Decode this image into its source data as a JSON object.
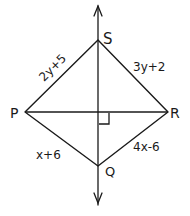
{
  "diagram": {
    "type": "kite/rhombus with diagonals",
    "vertices": {
      "S": {
        "label": "S",
        "x": 98,
        "y": 40
      },
      "R": {
        "label": "R",
        "x": 168,
        "y": 112
      },
      "Q": {
        "label": "Q",
        "x": 98,
        "y": 166
      },
      "P": {
        "label": "P",
        "x": 25,
        "y": 112
      }
    },
    "sides": {
      "PS": "2y+5",
      "SR": "3y+2",
      "PQ": "x+6",
      "QR": "4x-6"
    },
    "axis": {
      "top_arrow": true,
      "bottom_arrow": true
    },
    "right_angle_marker": true,
    "stroke_color": "#1a1a1a",
    "background": "#ffffff"
  }
}
